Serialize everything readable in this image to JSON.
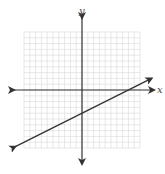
{
  "diagram": {
    "type": "coordinate-plane-with-line",
    "x_axis_label": "x",
    "y_axis_label": "y",
    "grid": {
      "x_range": [
        -10,
        10
      ],
      "y_range": [
        -10,
        10
      ],
      "step": 1
    },
    "line": {
      "slope": 0.5,
      "y_intercept": -4,
      "x_intercept": 8,
      "arrows": "both"
    },
    "colors": {
      "axis": "#333333",
      "grid": "#d8d8d8",
      "line": "#333333"
    }
  }
}
